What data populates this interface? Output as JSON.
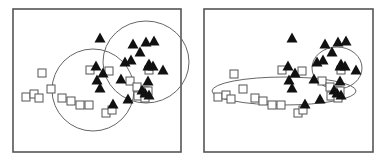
{
  "colors": {
    "frame": "#555555",
    "ellipse": "#666666",
    "square_stroke": "#555555",
    "triangle_fill": "#111111"
  },
  "chart_data": [
    {
      "type": "scatter",
      "title": "",
      "xlabel": "",
      "ylabel": "",
      "panel": "left",
      "frame": [
        13,
        9,
        181,
        152
      ],
      "series": [
        {
          "name": "squares (open)",
          "marker": "open-square",
          "points": [
            [
              42,
              73
            ],
            [
              26,
              97
            ],
            [
              34,
              94
            ],
            [
              39,
              98
            ],
            [
              51,
              89
            ],
            [
              62,
              98
            ],
            [
              71,
              101
            ],
            [
              80,
              105
            ],
            [
              89,
              105
            ],
            [
              90,
              70
            ],
            [
              109,
              71
            ],
            [
              130,
              81
            ],
            [
              137,
              87
            ],
            [
              138,
              96
            ],
            [
              145,
              98
            ],
            [
              145,
              91
            ],
            [
              148,
              91
            ],
            [
              106,
              113
            ],
            [
              112,
              110
            ],
            [
              149,
              70
            ]
          ]
        },
        {
          "name": "triangles (filled)",
          "marker": "filled-triangle",
          "points": [
            [
              100,
              38
            ],
            [
              133,
              44
            ],
            [
              146,
              42
            ],
            [
              154,
              41
            ],
            [
              140,
              52
            ],
            [
              96,
              66
            ],
            [
              103,
              73
            ],
            [
              97,
              80
            ],
            [
              100,
              88
            ],
            [
              125,
              62
            ],
            [
              131,
              60
            ],
            [
              149,
              64
            ],
            [
              153,
              66
            ],
            [
              148,
              66
            ],
            [
              163,
              70
            ],
            [
              121,
              79
            ],
            [
              148,
              81
            ],
            [
              142,
              90
            ],
            [
              145,
              93
            ],
            [
              149,
              95
            ],
            [
              113,
              104
            ],
            [
              128,
              99
            ]
          ]
        }
      ],
      "ellipses": [
        {
          "cx": 93,
          "cy": 90,
          "rx": 41,
          "ry": 41
        },
        {
          "cx": 146,
          "cy": 62,
          "rx": 43,
          "ry": 41
        }
      ]
    },
    {
      "type": "scatter",
      "title": "",
      "xlabel": "",
      "ylabel": "",
      "panel": "right",
      "frame": [
        204,
        9,
        373,
        152
      ],
      "series": [
        {
          "name": "squares (open)",
          "marker": "open-square",
          "points": [
            [
              234,
              74
            ],
            [
              218,
              97
            ],
            [
              226,
              95
            ],
            [
              231,
              99
            ],
            [
              243,
              89
            ],
            [
              255,
              98
            ],
            [
              263,
              101
            ],
            [
              272,
              105
            ],
            [
              281,
              105
            ],
            [
              282,
              70
            ],
            [
              302,
              71
            ],
            [
              322,
              81
            ],
            [
              330,
              87
            ],
            [
              331,
              96
            ],
            [
              338,
              98
            ],
            [
              338,
              91
            ],
            [
              340,
              91
            ],
            [
              298,
              113
            ],
            [
              303,
              110
            ],
            [
              341,
              70
            ]
          ]
        },
        {
          "name": "triangles (filled)",
          "marker": "filled-triangle",
          "points": [
            [
              292,
              38
            ],
            [
              325,
              44
            ],
            [
              338,
              42
            ],
            [
              346,
              41
            ],
            [
              332,
              52
            ],
            [
              288,
              66
            ],
            [
              295,
              73
            ],
            [
              289,
              80
            ],
            [
              292,
              88
            ],
            [
              317,
              62
            ],
            [
              323,
              60
            ],
            [
              341,
              64
            ],
            [
              345,
              66
            ],
            [
              340,
              66
            ],
            [
              356,
              70
            ],
            [
              314,
              79
            ],
            [
              340,
              81
            ],
            [
              334,
              90
            ],
            [
              337,
              93
            ],
            [
              341,
              95
            ],
            [
              305,
              104
            ],
            [
              320,
              99
            ]
          ]
        }
      ],
      "ellipses": [
        {
          "cx": 284,
          "cy": 91,
          "rx": 72,
          "ry": 14
        },
        {
          "cx": 337,
          "cy": 68,
          "rx": 25,
          "ry": 21
        }
      ]
    }
  ]
}
